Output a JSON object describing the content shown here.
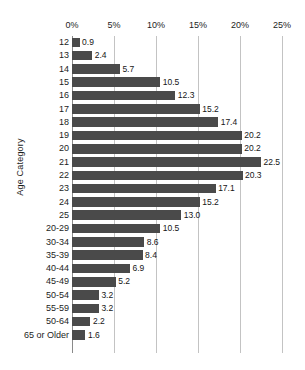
{
  "chart_data": {
    "type": "bar",
    "orientation": "horizontal",
    "title": "",
    "xlabel": "",
    "ylabel": "Age Category",
    "xlim": [
      0,
      25
    ],
    "xtick_labels": [
      "0%",
      "5%",
      "10%",
      "15%",
      "20%",
      "25%"
    ],
    "xticks": [
      0,
      5,
      10,
      15,
      20,
      25
    ],
    "grid": true,
    "legend": false,
    "value_label_format": "one-decimal",
    "categories": [
      "12",
      "13",
      "14",
      "15",
      "16",
      "17",
      "18",
      "19",
      "20",
      "21",
      "22",
      "23",
      "24",
      "25",
      "20-29",
      "30-34",
      "35-39",
      "40-44",
      "45-49",
      "50-54",
      "55-59",
      "50-64",
      "65 or Older"
    ],
    "values": [
      0.9,
      2.4,
      5.7,
      10.5,
      12.3,
      15.2,
      17.4,
      20.2,
      20.2,
      22.5,
      20.3,
      17.1,
      15.2,
      13.0,
      10.5,
      8.6,
      8.4,
      6.9,
      5.2,
      3.2,
      3.2,
      2.2,
      1.6
    ],
    "value_labels": [
      "0.9",
      "2.4",
      "5.7",
      "10.5",
      "12.3",
      "15.2",
      "17.4",
      "20.2",
      "20.2",
      "22.5",
      "20.3",
      "17.1",
      "15.2",
      "13.0",
      "10.5",
      "8.6",
      "8.4",
      "6.9",
      "5.2",
      "3.2",
      "3.2",
      "2.2",
      "1.6"
    ],
    "bar_color": "#4a4a4a",
    "grid_color": "#c3c3c3",
    "axis_color": "#8a8a8a",
    "background_color": "#ffffff"
  }
}
